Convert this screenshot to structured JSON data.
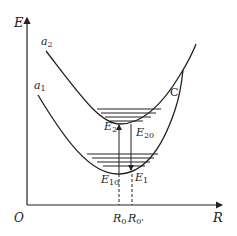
{
  "diagram": {
    "type": "potential-energy-curves",
    "axes": {
      "y_label": "E",
      "x_label": "R",
      "origin_label": "O"
    },
    "curves": [
      {
        "name": "a2",
        "label_main": "a",
        "label_sub": "2"
      },
      {
        "name": "a1",
        "label_main": "a",
        "label_sub": "1"
      }
    ],
    "crossing_point": {
      "label": "C"
    },
    "energy_labels": [
      {
        "main": "E",
        "sub": "2"
      },
      {
        "main": "E",
        "sub": "20"
      },
      {
        "main": "E",
        "sub": "10"
      },
      {
        "main": "E",
        "sub": "1"
      }
    ],
    "x_markers": [
      {
        "main": "R",
        "sub": "0"
      },
      {
        "main": "R",
        "sub": "0'"
      }
    ],
    "colors": {
      "line": "#222222",
      "background": "#ffffff"
    }
  }
}
